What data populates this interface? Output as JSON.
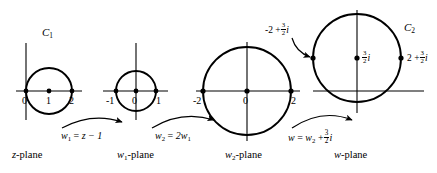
{
  "figure": {
    "background": "#ffffff",
    "ink": "#000000"
  },
  "panels": [
    {
      "id": "z-plane",
      "plane_label": "z-plane",
      "curve_label": "C",
      "curve_label_sub": "1",
      "circle": {
        "center_re": 1,
        "center_im": 0,
        "radius": 1
      },
      "axis_ticks": [
        "0",
        "1",
        "2"
      ],
      "marked_points": [
        "0",
        "1",
        "2"
      ]
    },
    {
      "id": "w1-plane",
      "plane_label": "w",
      "plane_label_sub": "1",
      "plane_label_tail": "-plane",
      "circle": {
        "center_re": 0,
        "center_im": 0,
        "radius": 1
      },
      "axis_ticks": [
        "-1",
        "0",
        "1"
      ],
      "marked_points": [
        "-1",
        "0",
        "1"
      ]
    },
    {
      "id": "w2-plane",
      "plane_label": "w",
      "plane_label_sub": "2",
      "plane_label_tail": "-plane",
      "circle": {
        "center_re": 0,
        "center_im": 0,
        "radius": 2
      },
      "axis_ticks": [
        "-2",
        "0",
        "2"
      ],
      "marked_points": [
        "-2",
        "0",
        "2"
      ]
    },
    {
      "id": "w-plane",
      "plane_label": "w-plane",
      "curve_label": "C",
      "curve_label_sub": "2",
      "circle": {
        "center_re": 0,
        "center_im": 1.5,
        "radius": 2
      },
      "point_labels": {
        "left": {
          "real": "-2 +",
          "frac_num": "3",
          "frac_den": "2",
          "imag": "i"
        },
        "center": {
          "frac_num": "3",
          "frac_den": "2",
          "imag": "i"
        },
        "right": {
          "real": "2 +",
          "frac_num": "3",
          "frac_den": "2",
          "imag": "i"
        }
      }
    }
  ],
  "transformations": [
    {
      "id": "t1",
      "lhs": "w",
      "lhs_sub": "1",
      "eq": "=",
      "rhs": "z − 1"
    },
    {
      "id": "t2",
      "lhs": "w",
      "lhs_sub": "2",
      "eq": "=",
      "rhs": "2w",
      "rhs_sub": "1"
    },
    {
      "id": "t3",
      "lhs": "w",
      "eq": "=",
      "rhs": "w",
      "rhs_sub": "2",
      "rhs_tail": "+",
      "frac_num": "3",
      "frac_den": "2",
      "imag": "i"
    }
  ],
  "plane_labels": {
    "p1": "z-plane",
    "p4": "w-plane"
  }
}
